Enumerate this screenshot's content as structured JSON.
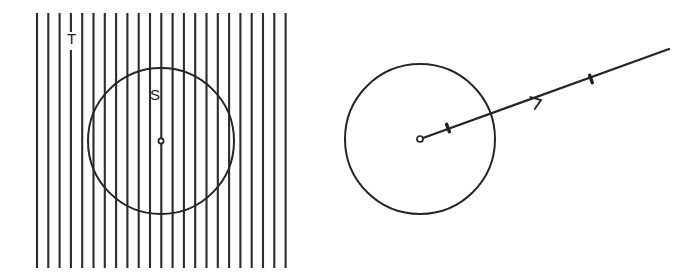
{
  "figure": {
    "background_color": "#ffffff",
    "ink_color": "#262626",
    "hatch_color": "#2b2b2b"
  },
  "left_panel": {
    "name": "hatched-region-panel",
    "labels": {
      "region_outer": "T",
      "region_inner": "S"
    },
    "label_positions": {
      "region_outer": {
        "x": 72,
        "y": 48
      },
      "region_inner": {
        "x": 155,
        "y": 100
      }
    },
    "hatching": {
      "orientation": "vertical",
      "line_count": 23,
      "x_start": 37,
      "spacing": 11.3,
      "y_top": 13,
      "y_bottom": 268,
      "stroke_width": 2.1,
      "color": "#2b2b2b"
    },
    "circle": {
      "name": "region-s-boundary",
      "cx": 161,
      "cy": 141,
      "r": 73,
      "stroke_width": 2.0,
      "color": "#262626"
    },
    "center_point": {
      "name": "region-s-center",
      "cx": 161,
      "cy": 141,
      "r": 2.6,
      "style": "open"
    }
  },
  "right_panel": {
    "name": "circle-with-ray-panel",
    "circle": {
      "name": "boundary-circle",
      "cx": 420,
      "cy": 139,
      "r": 75,
      "stroke_width": 2.0,
      "color": "#262626"
    },
    "center_point": {
      "name": "circle-center",
      "cx": 420,
      "cy": 139,
      "r": 3.0,
      "style": "open"
    },
    "ray": {
      "name": "outgoing-ray",
      "x1": 423,
      "y1": 138,
      "x2": 669,
      "y2": 49,
      "stroke_width": 2.2,
      "color": "#262626"
    },
    "arrow_head": {
      "name": "ray-direction-arrowhead",
      "x": 541,
      "y": 100,
      "size": 11,
      "direction": "up-right"
    },
    "tick_marks": [
      {
        "name": "ray-tick-inner",
        "x": 448,
        "y": 128,
        "length": 8
      },
      {
        "name": "ray-tick-outer",
        "x": 591,
        "y": 79,
        "length": 8
      }
    ]
  }
}
